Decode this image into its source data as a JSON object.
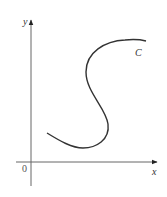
{
  "diagram": {
    "axes": {
      "x_label": "x",
      "y_label": "y",
      "origin_label": "0",
      "axis_color": "#555555"
    },
    "curve": {
      "label": "C",
      "color": "#333333"
    }
  }
}
